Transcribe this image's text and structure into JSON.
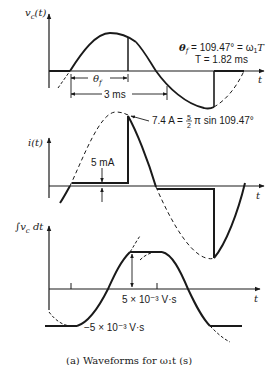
{
  "figure": {
    "caption": "(a) Waveforms for ω₁t (s)",
    "colors": {
      "ink": "#1a1a1a",
      "background": "#ffffff"
    }
  },
  "plots": [
    {
      "id": "vc",
      "y_label": "v",
      "y_label_sub": "c",
      "y_label_suffix": "(t)",
      "x_label": "t",
      "annotations": {
        "theta_label": "θ",
        "theta_sub": "f",
        "period_span": "3 ms",
        "eq1_lhs": "θ",
        "eq1_sub": "f",
        "eq1_rhs": " = 109.47° = ω",
        "eq1_omega_sub": "1",
        "eq1_T": "T",
        "eq2": "T = 1.82 ms"
      }
    },
    {
      "id": "i",
      "y_label": "i(t)",
      "x_label": "t",
      "annotations": {
        "offset": "5 mA",
        "peak_lhs": "7.4 A = ",
        "peak_frac_num": "5",
        "peak_frac_den": "2",
        "peak_rhs": "π sin 109.47°"
      }
    },
    {
      "id": "int_vc",
      "y_label": "∫v",
      "y_label_sub": "c",
      "y_label_suffix": " dt",
      "x_label": "t",
      "annotations": {
        "upper_level": "5 × 10⁻³ V·s",
        "lower_level": "−5 × 10⁻³ V·s"
      }
    }
  ]
}
